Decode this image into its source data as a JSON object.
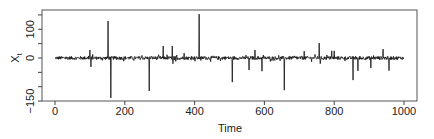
{
  "chart_data": {
    "type": "line",
    "title": "",
    "xlabel": "Time",
    "ylabel": "X_t",
    "ylabel_main": "X",
    "ylabel_sub": "t",
    "xlim": [
      0,
      1000
    ],
    "ylim": [
      -150,
      167
    ],
    "grid": false,
    "legend": null,
    "x_ticks": [
      0,
      200,
      400,
      600,
      800,
      1000
    ],
    "x_tick_labels": [
      "0",
      "200",
      "400",
      "600",
      "800",
      "1000"
    ],
    "y_ticks": [
      -150,
      -100,
      -50,
      0,
      50,
      100,
      150
    ],
    "y_tick_labels": [
      "−150",
      "",
      "",
      "0",
      "",
      "100",
      ""
    ],
    "n_points": 1000,
    "baseline_noise_amplitude": 6,
    "series": [
      {
        "name": "X_t",
        "description": "Heavy-tailed noise series around 0 with isolated spikes",
        "spikes": [
          {
            "t": 100,
            "value": 28
          },
          {
            "t": 103,
            "value": -31
          },
          {
            "t": 152,
            "value": 129
          },
          {
            "t": 160,
            "value": -139
          },
          {
            "t": 270,
            "value": -115
          },
          {
            "t": 310,
            "value": 42
          },
          {
            "t": 336,
            "value": 42
          },
          {
            "t": 338,
            "value": -20
          },
          {
            "t": 346,
            "value": -12
          },
          {
            "t": 370,
            "value": 17
          },
          {
            "t": 413,
            "value": 153
          },
          {
            "t": 508,
            "value": -84
          },
          {
            "t": 556,
            "value": -42
          },
          {
            "t": 573,
            "value": 28
          },
          {
            "t": 593,
            "value": -46
          },
          {
            "t": 657,
            "value": -112
          },
          {
            "t": 714,
            "value": 24
          },
          {
            "t": 757,
            "value": 52
          },
          {
            "t": 760,
            "value": -20
          },
          {
            "t": 793,
            "value": 25
          },
          {
            "t": 800,
            "value": 25
          },
          {
            "t": 854,
            "value": -77
          },
          {
            "t": 868,
            "value": -45
          },
          {
            "t": 905,
            "value": -35
          },
          {
            "t": 940,
            "value": 31
          },
          {
            "t": 957,
            "value": -44
          }
        ]
      }
    ]
  }
}
